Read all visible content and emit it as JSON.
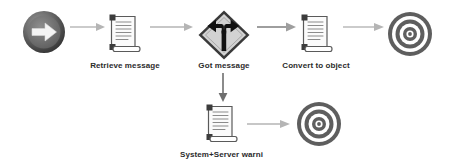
{
  "diagram": {
    "background_color": "#ffffff",
    "palette": {
      "icon_dark": "#4a4a4a",
      "icon_darker": "#333333",
      "arrow_light": "#b5b5b5",
      "arrow_dark": "#6e6e6e",
      "label_color": "#2b2b2b",
      "sign_fill": "#d0d0d0",
      "doc_fill": "#f2f2f2"
    },
    "nodes": [
      {
        "id": "start",
        "icon": "start-arrow-circle-icon",
        "label": "",
        "shape": "circle-arrow",
        "x": 22,
        "y": 10,
        "w": 44,
        "h": 44
      },
      {
        "id": "retrieve",
        "icon": "scroll-document-icon",
        "label": "Retrieve message",
        "shape": "scroll",
        "x": 108,
        "y": 13,
        "w": 33,
        "h": 42,
        "label_x": 81,
        "label_y": 61,
        "label_w": 88
      },
      {
        "id": "decision",
        "icon": "fork-road-sign-icon",
        "label": "Got message",
        "shape": "diamond-sign",
        "x": 197,
        "y": 9,
        "w": 54,
        "h": 52,
        "label_x": 188,
        "label_y": 61,
        "label_w": 72
      },
      {
        "id": "convert",
        "icon": "scroll-document-icon",
        "label": "Convert to object",
        "shape": "scroll",
        "x": 300,
        "y": 13,
        "w": 33,
        "h": 42,
        "label_x": 272,
        "label_y": 61,
        "label_w": 88
      },
      {
        "id": "end-top",
        "icon": "bullseye-target-icon",
        "label": "",
        "shape": "bullseye",
        "x": 387,
        "y": 11,
        "w": 46,
        "h": 46
      },
      {
        "id": "warning",
        "icon": "scroll-document-icon",
        "label": "System+Server warni",
        "shape": "scroll",
        "x": 205,
        "y": 103,
        "w": 33,
        "h": 42,
        "label_x": 165,
        "label_y": 150,
        "label_w": 113
      },
      {
        "id": "end-bottom",
        "icon": "bullseye-target-icon",
        "label": "",
        "shape": "bullseye",
        "x": 296,
        "y": 101,
        "w": 46,
        "h": 46
      }
    ],
    "connectors": [
      {
        "id": "start-to-retrieve",
        "from": "start",
        "to": "retrieve",
        "direction": "right",
        "x": 70,
        "y": 27,
        "length": 33,
        "weight": "light"
      },
      {
        "id": "retrieve-to-decision",
        "from": "retrieve",
        "to": "decision",
        "direction": "right",
        "x": 150,
        "y": 27,
        "length": 42,
        "weight": "light"
      },
      {
        "id": "decision-to-convert",
        "from": "decision",
        "to": "convert",
        "direction": "right",
        "x": 259,
        "y": 27,
        "length": 36,
        "weight": "medium"
      },
      {
        "id": "convert-to-end",
        "from": "convert",
        "to": "end-top",
        "direction": "right",
        "x": 343,
        "y": 27,
        "length": 40,
        "weight": "light"
      },
      {
        "id": "decision-to-warning",
        "from": "decision",
        "to": "warning",
        "direction": "down",
        "x": 222,
        "y": 73,
        "length": 28,
        "weight": "dark"
      },
      {
        "id": "warning-to-end",
        "from": "warning",
        "to": "end-bottom",
        "direction": "right",
        "x": 247,
        "y": 123,
        "length": 42,
        "weight": "light"
      }
    ]
  }
}
